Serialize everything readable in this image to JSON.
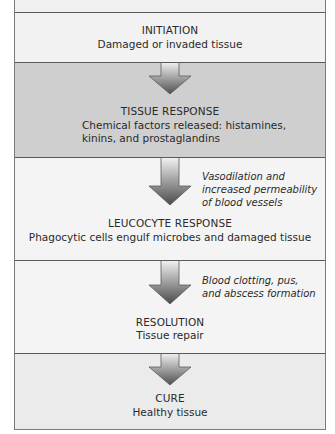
{
  "diagram": {
    "type": "vertical-flowchart",
    "colors": {
      "frame_border": "#7a7a7a",
      "separator": "#5a5a5a",
      "light_bg": "#f2f2f2",
      "shaded_bg": "#cfcfcf",
      "arrow_dark": "#555555",
      "arrow_light": "#f0f0f0"
    },
    "stages": [
      {
        "id": "initiation",
        "title": "INITIATION",
        "description": "Damaged or invaded tissue"
      },
      {
        "id": "tissue-response",
        "title": "TISSUE RESPONSE",
        "description_lines": [
          "Chemical factors released: histamines,",
          "kinins, and prostaglandins"
        ]
      },
      {
        "id": "leucocyte-response",
        "title": "LEUCOCYTE RESPONSE",
        "description": "Phagocytic cells engulf microbes and damaged tissue"
      },
      {
        "id": "resolution",
        "title": "RESOLUTION",
        "description": "Tissue repair"
      },
      {
        "id": "cure",
        "title": "CURE",
        "description": "Healthy tissue"
      }
    ],
    "transitions": [
      {
        "from": "initiation",
        "to": "tissue-response",
        "note_lines": []
      },
      {
        "from": "tissue-response",
        "to": "leucocyte-response",
        "note_lines": [
          "Vasodilation and",
          "increased permeability",
          "of blood vessels"
        ]
      },
      {
        "from": "leucocyte-response",
        "to": "resolution",
        "note_lines": [
          "Blood clotting, pus,",
          "and abscess formation"
        ]
      },
      {
        "from": "resolution",
        "to": "cure",
        "note_lines": []
      }
    ]
  }
}
